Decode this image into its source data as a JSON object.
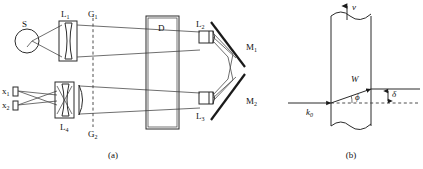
{
  "figure": {
    "width": 423,
    "height": 169,
    "background": "#ffffff",
    "ink_color": "#2b2b2b"
  },
  "panel_a": {
    "caption": "(a)",
    "labels": {
      "source": "S",
      "lens_1": "L",
      "lens_1_sub": "1",
      "lens_2": "L",
      "lens_2_sub": "2",
      "lens_3": "L",
      "lens_3_sub": "3",
      "lens_4": "L",
      "lens_4_sub": "4",
      "grating_1": "G",
      "grating_1_sub": "1",
      "grating_2": "G",
      "grating_2_sub": "2",
      "detector": "D",
      "mirror_1": "M",
      "mirror_1_sub": "1",
      "mirror_2": "M",
      "mirror_2_sub": "2",
      "slit_1": "x",
      "slit_1_sub": "1",
      "slit_2": "x",
      "slit_2_sub": "2"
    }
  },
  "panel_b": {
    "caption": "(b)",
    "labels": {
      "velocity": "v",
      "wave_vector": "k",
      "wave_vector_sub": "0",
      "beam_width": "W",
      "angle": "ϕ",
      "displacement": "δ"
    }
  }
}
